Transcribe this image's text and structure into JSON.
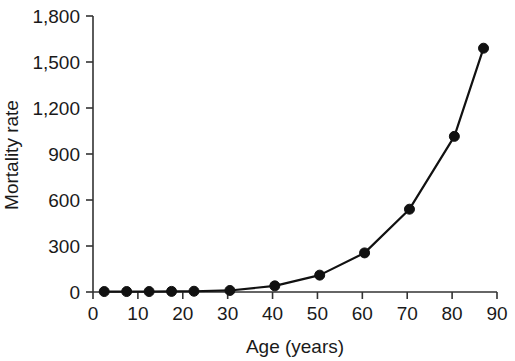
{
  "chart_data": {
    "type": "line",
    "title": "",
    "subtitle": "",
    "xlabel": "Age (years)",
    "ylabel": "Mortality rate",
    "xlim": [
      0,
      90
    ],
    "ylim": [
      0,
      1800
    ],
    "grid": false,
    "legend": null,
    "x_ticks": [
      0,
      10,
      20,
      30,
      40,
      50,
      60,
      70,
      80,
      90
    ],
    "x_tick_labels": [
      "0",
      "10",
      "20",
      "30",
      "40",
      "50",
      "60",
      "70",
      "80",
      "90"
    ],
    "y_ticks": [
      0,
      300,
      600,
      900,
      1200,
      1500,
      1800
    ],
    "y_tick_labels": [
      "0",
      "300",
      "600",
      "900",
      "1,200",
      "1,500",
      "1,800"
    ],
    "marker": "filled-circle",
    "marker_color": "#111111",
    "line_color": "#111111",
    "x": [
      2.5,
      7.5,
      12.5,
      17.5,
      22.5,
      30.5,
      40.5,
      50.5,
      60.5,
      70.5,
      80.5,
      87.0
    ],
    "y": [
      3,
      3,
      3,
      4,
      5,
      10,
      40,
      110,
      255,
      540,
      1015,
      1590
    ],
    "series": [
      {
        "name": "Mortality rate",
        "x": [
          2.5,
          7.5,
          12.5,
          17.5,
          22.5,
          30.5,
          40.5,
          50.5,
          60.5,
          70.5,
          80.5,
          87.0
        ],
        "values": [
          3,
          3,
          3,
          4,
          5,
          10,
          40,
          110,
          255,
          540,
          1015,
          1590
        ]
      }
    ],
    "annotations": []
  }
}
